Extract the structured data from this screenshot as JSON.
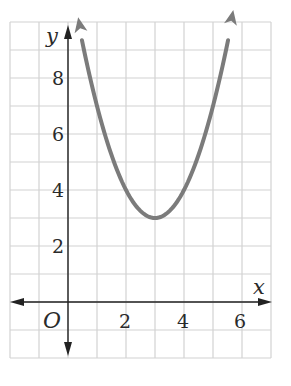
{
  "chart_data": {
    "type": "line",
    "title": "",
    "xlabel": "x",
    "ylabel": "y",
    "origin_label": "O",
    "xlim": [
      -2,
      7
    ],
    "ylim": [
      -2,
      10
    ],
    "grid": true,
    "grid_step": 1,
    "x_ticks": [
      2,
      4,
      6
    ],
    "y_ticks": [
      2,
      4,
      6,
      8
    ],
    "x_tick_labels": [
      "2",
      "4",
      "6"
    ],
    "y_tick_labels": [
      "2",
      "4",
      "6",
      "8"
    ],
    "series": [
      {
        "name": "y = (x - 3)^2 + 3",
        "kind": "parabola",
        "vertex": [
          3,
          3
        ],
        "a": 1,
        "x": [
          0.4,
          1,
          1.5,
          2,
          2.5,
          3,
          3.5,
          4,
          4.5,
          5,
          5.6
        ],
        "y": [
          9.76,
          7,
          5.25,
          4,
          3.25,
          3,
          3.25,
          4,
          5.25,
          7,
          9.76
        ],
        "arrows_at_ends": true,
        "color": "#7b7b7b"
      }
    ],
    "colors": {
      "grid": "#d2d2d2",
      "axis": "#222222",
      "curve": "#7b7b7b"
    }
  },
  "labels": {
    "x_axis": "x",
    "y_axis": "y",
    "origin": "O",
    "x_ticks": [
      "2",
      "4",
      "6"
    ],
    "y_ticks": [
      "8",
      "6",
      "4",
      "2"
    ]
  }
}
